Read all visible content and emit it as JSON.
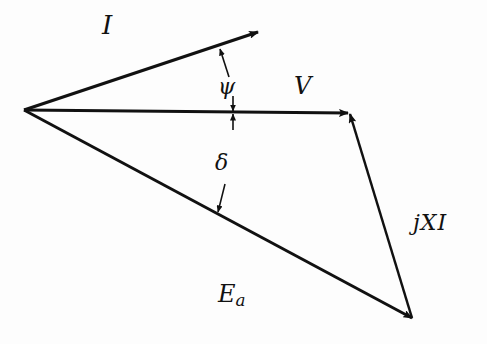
{
  "diagram": {
    "type": "phasor-diagram",
    "origin": [
      24,
      110
    ],
    "phasors": [
      {
        "name": "I",
        "label": "I",
        "from": [
          24,
          110
        ],
        "to": [
          258,
          32
        ]
      },
      {
        "name": "V",
        "label": "V",
        "from": [
          24,
          110
        ],
        "to": [
          350,
          113
        ]
      },
      {
        "name": "Ea",
        "label_main": "E",
        "label_sub": "a",
        "from": [
          24,
          110
        ],
        "to": [
          412,
          318
        ]
      },
      {
        "name": "jXI",
        "label": "jXI",
        "from": [
          412,
          318
        ],
        "to": [
          350,
          113
        ]
      }
    ],
    "angles": [
      {
        "name": "psi",
        "label": "ψ",
        "between": [
          "I",
          "V"
        ]
      },
      {
        "name": "delta",
        "label": "δ",
        "between": [
          "V",
          "Ea"
        ]
      }
    ],
    "line_color": "#111111",
    "background": "#fdfdfd"
  }
}
